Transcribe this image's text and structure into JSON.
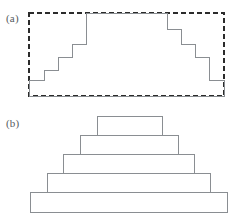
{
  "figure": {
    "width": 251,
    "height": 218,
    "background": "#ffffff",
    "stroke_color": "#8a8e92",
    "dashed_stroke_color": "#2b2b2b",
    "label_color": "#555a5e"
  },
  "panels": [
    {
      "id": "a",
      "label": "(a)",
      "description": "Dashed bounding rectangle enclosing a symmetric staircase (ziggurat) outline",
      "bounding_box": {
        "x": 29,
        "y": 13,
        "width": 195,
        "height": 83
      },
      "bounding_box_style": "dashed",
      "staircase_note": "Solid polyline: symmetric stepped profile rising from the left baseline to a flat plateau and descending on the right",
      "step_count_per_side": 4
    },
    {
      "id": "b",
      "label": "(b)",
      "description": "Five stacked rectangles of decreasing width forming a stepped pyramid",
      "layer_count": 5,
      "layers": [
        {
          "index": 1,
          "name": "layer-bottom",
          "x": 30,
          "y": 192,
          "width": 197,
          "height": 20
        },
        {
          "index": 2,
          "name": "layer-4",
          "x": 47,
          "y": 173,
          "width": 163,
          "height": 19
        },
        {
          "index": 3,
          "name": "layer-3",
          "x": 63,
          "y": 154,
          "width": 131,
          "height": 19
        },
        {
          "index": 4,
          "name": "layer-2",
          "x": 80,
          "y": 135,
          "width": 98,
          "height": 19
        },
        {
          "index": 5,
          "name": "layer-top",
          "x": 97,
          "y": 116,
          "width": 65,
          "height": 19
        }
      ]
    }
  ],
  "chart_data": {
    "type": "line",
    "title": "",
    "xlabel": "",
    "ylabel": "",
    "grid": false,
    "legend": "none",
    "panel_a": {
      "name": "staircase-outline",
      "xlim": [
        29,
        224
      ],
      "ylim": [
        13,
        96
      ],
      "dashed_rect": {
        "x0": 29,
        "y0": 13,
        "x1": 224,
        "y1": 96
      },
      "baseline_y": 96,
      "outline_points": [
        [
          29,
          96
        ],
        [
          29,
          80
        ],
        [
          44,
          80
        ],
        [
          44,
          70
        ],
        [
          58,
          70
        ],
        [
          58,
          57
        ],
        [
          72,
          57
        ],
        [
          72,
          44
        ],
        [
          86,
          44
        ],
        [
          86,
          13
        ],
        [
          167,
          13
        ],
        [
          167,
          29
        ],
        [
          181,
          29
        ],
        [
          181,
          44
        ],
        [
          195,
          44
        ],
        [
          195,
          57
        ],
        [
          209,
          57
        ],
        [
          209,
          80
        ],
        [
          224,
          80
        ],
        [
          224,
          96
        ],
        [
          29,
          96
        ]
      ]
    },
    "panel_b": {
      "name": "stacked-pyramid",
      "categories": [
        "layer-bottom",
        "layer-4",
        "layer-3",
        "layer-2",
        "layer-top"
      ],
      "values": [
        197,
        163,
        131,
        98,
        65
      ],
      "ylabel": "layer width (px)",
      "xlim": [
        30,
        227
      ],
      "ylim": [
        116,
        212
      ]
    }
  }
}
